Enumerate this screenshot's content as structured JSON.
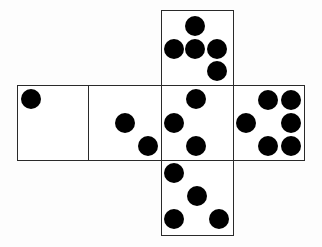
{
  "diagram": {
    "type": "cube-net",
    "colors": {
      "line": "#2a2a2a",
      "dot": "#000000",
      "background": "#ffffff"
    },
    "dot_radius": 10,
    "faces": [
      {
        "id": "top",
        "x": 161,
        "y": 10,
        "w": 73,
        "h": 76,
        "pip_count": 5,
        "dots": [
          [
            195,
            26
          ],
          [
            174,
            49
          ],
          [
            195,
            49
          ],
          [
            217,
            49
          ],
          [
            217,
            71
          ]
        ]
      },
      {
        "id": "row-1",
        "x": 17,
        "y": 85,
        "w": 72,
        "h": 76,
        "pip_count": 1,
        "dots": [
          [
            31,
            99
          ]
        ]
      },
      {
        "id": "row-2",
        "x": 88,
        "y": 85,
        "w": 74,
        "h": 76,
        "pip_count": 2,
        "dots": [
          [
            125,
            123
          ],
          [
            148,
            146
          ]
        ]
      },
      {
        "id": "row-3-center",
        "x": 161,
        "y": 85,
        "w": 73,
        "h": 76,
        "pip_count": 3,
        "dots": [
          [
            196,
            99
          ],
          [
            174,
            123
          ],
          [
            196,
            146
          ]
        ]
      },
      {
        "id": "row-4",
        "x": 233,
        "y": 85,
        "w": 72,
        "h": 76,
        "pip_count": 6,
        "dots": [
          [
            268,
            100
          ],
          [
            291,
            100
          ],
          [
            246,
            123
          ],
          [
            291,
            123
          ],
          [
            268,
            146
          ],
          [
            291,
            146
          ]
        ]
      },
      {
        "id": "bottom",
        "x": 161,
        "y": 160,
        "w": 73,
        "h": 76,
        "pip_count": 4,
        "dots": [
          [
            174,
            173
          ],
          [
            197,
            196
          ],
          [
            174,
            219
          ],
          [
            219,
            219
          ]
        ]
      }
    ]
  }
}
